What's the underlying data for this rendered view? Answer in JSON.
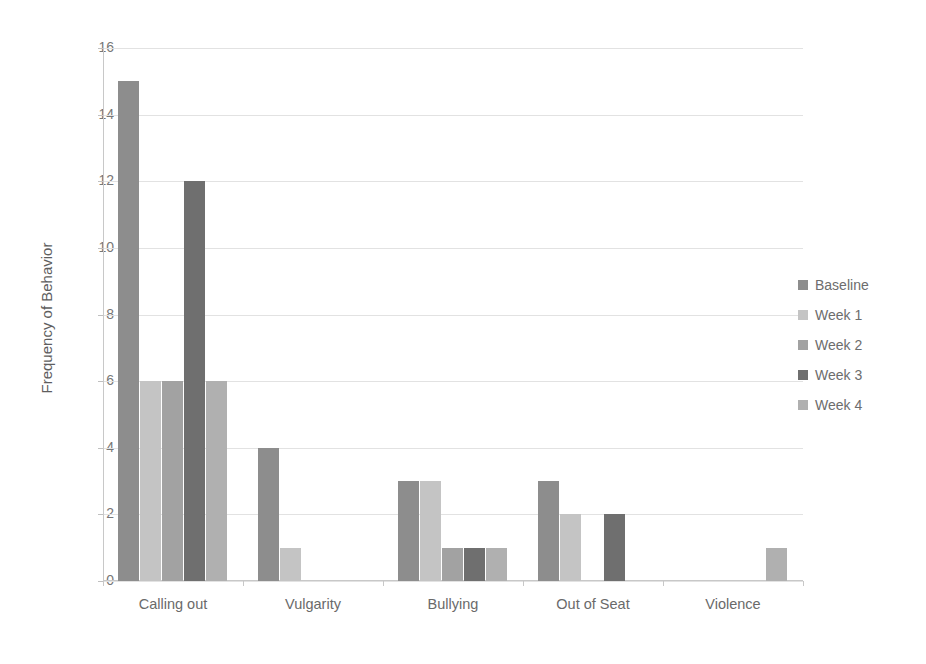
{
  "chart_data": {
    "type": "bar",
    "title": "",
    "xlabel": "",
    "ylabel": "Frequency of Behavior",
    "ylim": [
      0,
      16
    ],
    "ytick_step": 2,
    "yticks": [
      0,
      2,
      4,
      6,
      8,
      10,
      12,
      14,
      16
    ],
    "grid": true,
    "legend_position": "right",
    "categories": [
      "Calling out",
      "Vulgarity",
      "Bullying",
      "Out of Seat",
      "Violence"
    ],
    "series": [
      {
        "name": "Baseline",
        "color": "#8d8d8d",
        "values": [
          15,
          4,
          3,
          3,
          0
        ]
      },
      {
        "name": "Week 1",
        "color": "#c4c4c4",
        "values": [
          6,
          1,
          3,
          2,
          0
        ]
      },
      {
        "name": "Week 2",
        "color": "#a2a2a2",
        "values": [
          6,
          0,
          1,
          0,
          0
        ]
      },
      {
        "name": "Week 3",
        "color": "#6f6f6f",
        "values": [
          12,
          0,
          1,
          2,
          0
        ]
      },
      {
        "name": "Week 4",
        "color": "#b0b0b0",
        "values": [
          6,
          0,
          1,
          0,
          1
        ]
      }
    ]
  },
  "colors": {
    "background": "#ffffff",
    "gridline": "#e2e2e2",
    "axis": "#c8c8c8",
    "text": "#6d6d6d"
  }
}
